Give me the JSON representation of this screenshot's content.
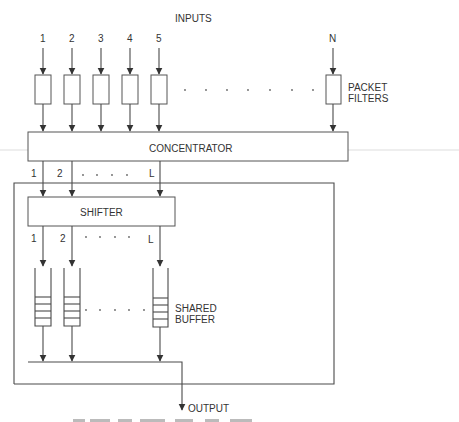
{
  "diagram": {
    "inputs_title": "INPUTS",
    "input_labels": [
      "1",
      "2",
      "3",
      "4",
      "5",
      "N"
    ],
    "packet_filters_label": [
      "PACKET",
      "FILTERS"
    ],
    "concentrator_label": "CONCENTRATOR",
    "concentrator_outputs": [
      "1",
      "2",
      "L"
    ],
    "shifter_label": "SHIFTER",
    "shifter_outputs": [
      "1",
      "2",
      "L"
    ],
    "shared_buffer_label": [
      "SHARED",
      "BUFFER"
    ],
    "output_label": "OUTPUT"
  },
  "colors": {
    "line": "#4a4a4a",
    "text": "#333333",
    "background": "#ffffff"
  }
}
